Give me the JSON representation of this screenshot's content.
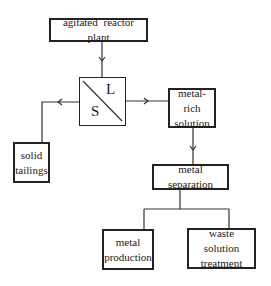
{
  "diagram": {
    "title": "",
    "nodes": {
      "reactor": {
        "label": "agitated reactor plant"
      },
      "separator": {
        "label_solid": "S",
        "label_liquid": "L"
      },
      "metal_rich": {
        "line1": "metal-rich",
        "line2": "solution"
      },
      "tailings": {
        "line1": "solid",
        "line2": "tailings"
      },
      "metal_separation": {
        "label": "metal separation"
      },
      "metal_production": {
        "line1": "metal",
        "line2": "production"
      },
      "waste_treatment": {
        "line1": "waste solution",
        "line2": "treatment"
      }
    },
    "edges": [
      {
        "from": "agitated reactor plant",
        "to": "S/L separator"
      },
      {
        "from": "S/L separator",
        "to": "solid tailings"
      },
      {
        "from": "S/L separator",
        "to": "metal-rich solution"
      },
      {
        "from": "metal-rich solution",
        "to": "metal separation"
      },
      {
        "from": "metal separation",
        "to": "metal production"
      },
      {
        "from": "metal separation",
        "to": "waste solution treatment"
      }
    ],
    "colors": {
      "line": "#222222",
      "background": "#ffffff"
    }
  }
}
